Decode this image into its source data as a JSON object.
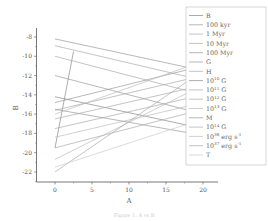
{
  "chart_data": {
    "type": "line",
    "title": "",
    "xlabel": "A",
    "ylabel": "B",
    "xlim": [
      -3,
      22
    ],
    "ylim": [
      -23,
      -7
    ],
    "xticks": [
      0,
      5,
      10,
      15,
      20
    ],
    "yticks": [
      -8,
      -10,
      -12,
      -14,
      -16,
      -18,
      -20,
      -22
    ],
    "grid": false,
    "legend_position": "upper right",
    "series": [
      {
        "name": "B",
        "x": [
          0,
          2.5
        ],
        "y": [
          -19.5,
          -9.5
        ],
        "color": "#888888"
      },
      {
        "name": "100 kyr",
        "x": [
          0,
          20
        ],
        "y": [
          -8.2,
          -11.5
        ],
        "color": "#999999"
      },
      {
        "name": "1 Myr",
        "x": [
          0,
          20
        ],
        "y": [
          -8.9,
          -12.5
        ],
        "color": "#aaaaaa"
      },
      {
        "name": "10 Myr",
        "x": [
          0,
          20
        ],
        "y": [
          -10.0,
          -14.0
        ],
        "color": "#aaaaaa"
      },
      {
        "name": "100 Myr",
        "x": [
          0,
          20
        ],
        "y": [
          -12.0,
          -16.0
        ],
        "color": "#999999"
      },
      {
        "name": "G",
        "x": [
          0,
          20
        ],
        "y": [
          -14.8,
          -11.0
        ],
        "color": "#999999"
      },
      {
        "name": "H",
        "x": [
          0,
          20
        ],
        "y": [
          -15.6,
          -12.0
        ],
        "color": "#aaaaaa"
      },
      {
        "name": "10^10 G",
        "x": [
          0,
          20
        ],
        "y": [
          -14.2,
          -17.5
        ],
        "color": "#888888"
      },
      {
        "name": "10^11 G",
        "x": [
          0,
          20
        ],
        "y": [
          -16.5,
          -13.0
        ],
        "color": "#aaaaaa"
      },
      {
        "name": "10^12 G",
        "x": [
          0,
          20
        ],
        "y": [
          -17.5,
          -14.0
        ],
        "color": "#aaaaaa"
      },
      {
        "name": "10^13 G",
        "x": [
          0,
          20
        ],
        "y": [
          -18.4,
          -14.8
        ],
        "color": "#bbbbbb"
      },
      {
        "name": "M",
        "x": [
          0,
          20
        ],
        "y": [
          -15.5,
          -18.2
        ],
        "color": "#999999"
      },
      {
        "name": "10^14 G",
        "x": [
          0,
          20
        ],
        "y": [
          -19.5,
          -15.5
        ],
        "color": "#aaaaaa"
      },
      {
        "name": "10^36 erg s^-1",
        "x": [
          0,
          20
        ],
        "y": [
          -20.7,
          -13.0
        ],
        "color": "#bbbbbb"
      },
      {
        "name": "10^37 erg s^-1",
        "x": [
          0,
          20
        ],
        "y": [
          -22.0,
          -11.5
        ],
        "color": "#aaaaaa"
      },
      {
        "name": "T",
        "x": [
          0,
          20
        ],
        "y": [
          -21.5,
          -16.5
        ],
        "color": "#cccccc"
      },
      {
        "name": "",
        "x": [
          0,
          20
        ],
        "y": [
          -16.0,
          -10.5
        ],
        "color": "#bbbbbb"
      }
    ]
  },
  "legend": [
    {
      "base": "B",
      "sup": "",
      "tail": ""
    },
    {
      "base": "100 kyr",
      "sup": "",
      "tail": ""
    },
    {
      "base": "1 Myr",
      "sup": "",
      "tail": ""
    },
    {
      "base": "10 Myr",
      "sup": "",
      "tail": ""
    },
    {
      "base": "100 Myr",
      "sup": "",
      "tail": ""
    },
    {
      "base": "G",
      "sup": "",
      "tail": ""
    },
    {
      "base": "H",
      "sup": "",
      "tail": ""
    },
    {
      "base": "10",
      "sup": "10",
      "tail": " G"
    },
    {
      "base": "10",
      "sup": "11",
      "tail": " G"
    },
    {
      "base": "10",
      "sup": "12",
      "tail": " G"
    },
    {
      "base": "10",
      "sup": "13",
      "tail": " G"
    },
    {
      "base": "M",
      "sup": "",
      "tail": ""
    },
    {
      "base": "10",
      "sup": "14",
      "tail": " G"
    },
    {
      "base": "10",
      "sup": "36",
      "tail": " erg s",
      "sup2": "-1"
    },
    {
      "base": "10",
      "sup": "37",
      "tail": " erg s",
      "sup2": "-1"
    },
    {
      "base": "T",
      "sup": "",
      "tail": ""
    }
  ],
  "axes": {
    "x_label": "A",
    "y_label": "B",
    "x_ticks": [
      "0",
      "5",
      "10",
      "15",
      "20"
    ],
    "y_ticks": [
      "-8",
      "-10",
      "-12",
      "-14",
      "-16",
      "-18",
      "-20",
      "-22"
    ]
  },
  "caption": "Figure 1.  A vs B"
}
